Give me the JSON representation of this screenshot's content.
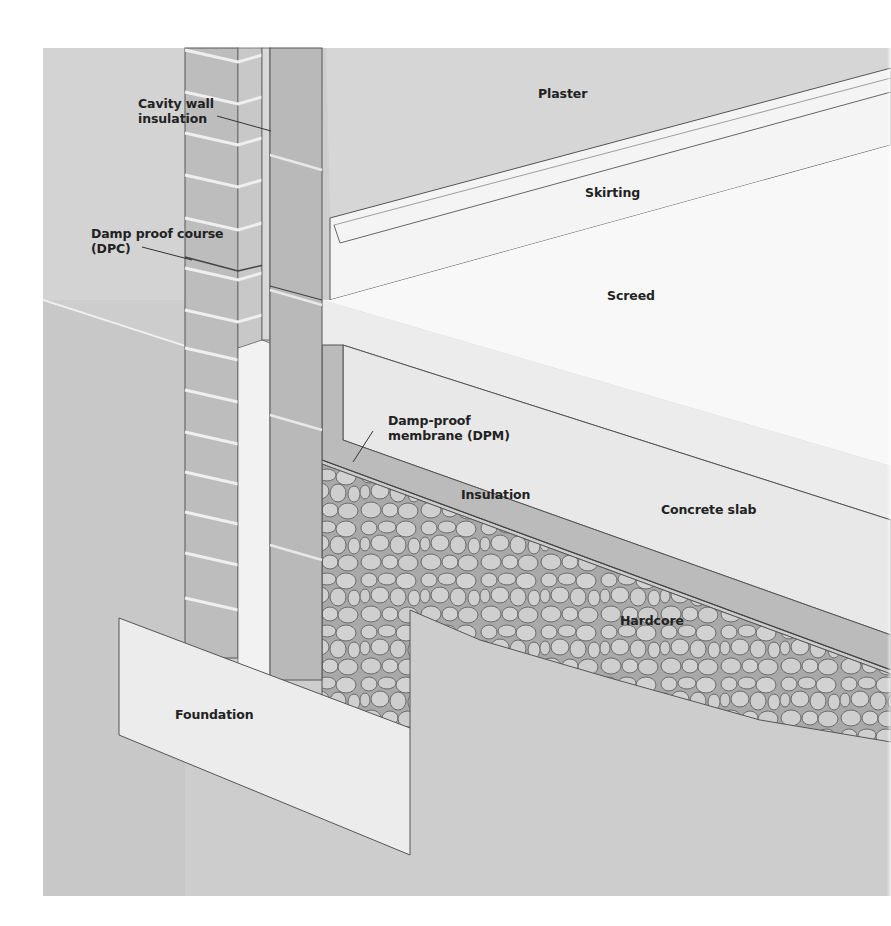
{
  "diagram": {
    "type": "cross-section",
    "colors": {
      "background_panel": "#cdcdcd",
      "ground": "#c9c9c9",
      "brick": "#bdbdbd",
      "brick_side": "#c8c8c8",
      "mortar": "#efefef",
      "block": "#b9b9b9",
      "plaster": "#d6d6d6",
      "skirting": "#f4f4f4",
      "screed": "#f7f7f7",
      "concrete": "#e9e9e9",
      "insulation": "#bcbcbc",
      "hardcore_stone": "#cfcfcf",
      "foundation": "#ececec",
      "line": "#555555",
      "text": "#222222"
    }
  },
  "labels": {
    "cavity_wall_insulation": [
      "Cavity wall",
      "insulation"
    ],
    "plaster": "Plaster",
    "skirting": "Skirting",
    "dpc": [
      "Damp proof course",
      "(DPC)"
    ],
    "screed": "Screed",
    "dpm": [
      "Damp-proof",
      "membrane (DPM)"
    ],
    "insulation": "Insulation",
    "concrete_slab": "Concrete slab",
    "hardcore": "Hardcore",
    "foundation": "Foundation"
  }
}
